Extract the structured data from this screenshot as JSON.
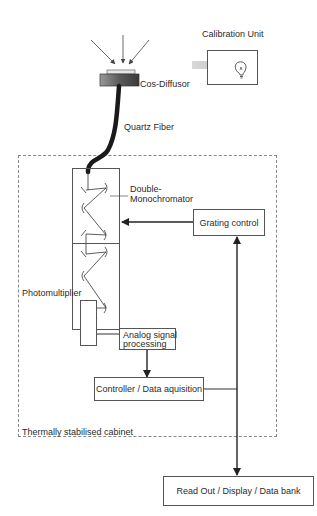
{
  "diagram": {
    "components": {
      "cos_diffusor": {
        "label": "Cos-Diffusor"
      },
      "calibration_unit": {
        "label": "Calibration Unit"
      },
      "quartz_fiber": {
        "label": "Quartz Fiber"
      },
      "double_monochromator": {
        "label_line1": "Double-",
        "label_line2": "Monochromator"
      },
      "grating_control": {
        "label": "Grating control"
      },
      "photomultiplier": {
        "label": "Photomultiplier"
      },
      "analog_signal_processing": {
        "label_line1": "Analog signal",
        "label_line2": "processing"
      },
      "controller": {
        "label": "Controller / Data aquisition"
      },
      "cabinet": {
        "label": "Thermally stabilised cabinet"
      },
      "readout": {
        "label": "Read Out / Display / Data bank"
      }
    },
    "connections": [
      {
        "from": "incoming-light",
        "to": "cos_diffusor"
      },
      {
        "from": "cos_diffusor",
        "to": "double_monochromator",
        "via": "quartz_fiber"
      },
      {
        "from": "grating_control",
        "to": "double_monochromator"
      },
      {
        "from": "double_monochromator",
        "to": "photomultiplier"
      },
      {
        "from": "photomultiplier",
        "to": "analog_signal_processing"
      },
      {
        "from": "analog_signal_processing",
        "to": "controller"
      },
      {
        "from": "controller",
        "to": "grating_control"
      },
      {
        "from": "controller",
        "to": "readout"
      }
    ],
    "colors": {
      "line": "#222222",
      "box_border": "#555555",
      "dashed_border": "#888888",
      "fiber": "#1a1a1a",
      "beam": "#c8c8c8"
    }
  }
}
